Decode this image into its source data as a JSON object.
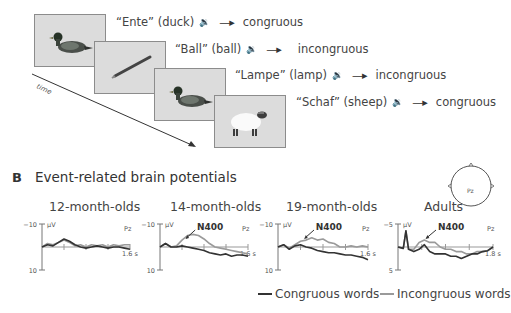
{
  "panelA": {
    "trials": [
      {
        "word": "“Ente” (duck)",
        "image": "duck",
        "condition": "congruous"
      },
      {
        "word": "“Ball” (ball)",
        "image": "pencil",
        "condition": "incongruous"
      },
      {
        "word": "“Lampe” (lamp)",
        "image": "duck",
        "condition": "incongruous"
      },
      {
        "word": "“Schaf” (sheep)",
        "image": "sheep",
        "condition": "congruous"
      }
    ],
    "time_axis_label": "time",
    "speaker_icon": "🔉",
    "arrow_icon": "→"
  },
  "panelB": {
    "label": "B",
    "title": "Event-related brain potentials",
    "electrode": "Pz",
    "legend": {
      "congruous": "Congruous words",
      "incongruous": "Incongruous words"
    },
    "colors": {
      "congruous": "#333333",
      "incongruous": "#9a9a9a"
    }
  },
  "chart_data": [
    {
      "type": "line",
      "title": "12-month-olds",
      "xlabel": "s",
      "ylabel": "μV",
      "x_end_label": "1.6 s",
      "ytick_top": "−10",
      "ytick_bottom": "10",
      "ylim": [
        -10,
        10
      ],
      "xlim": [
        0,
        1.6
      ],
      "y_inverted": true,
      "channel": "Pz",
      "annotation": null,
      "x": [
        0,
        0.1,
        0.2,
        0.3,
        0.4,
        0.5,
        0.6,
        0.7,
        0.8,
        0.9,
        1.0,
        1.1,
        1.2,
        1.3,
        1.4,
        1.5,
        1.6
      ],
      "series": [
        {
          "name": "Congruous words",
          "values": [
            0,
            -1,
            -0.5,
            -2,
            -3.5,
            -2.5,
            -1,
            0,
            0.5,
            0,
            -0.5,
            0,
            0.5,
            0,
            0,
            0.5,
            1
          ]
        },
        {
          "name": "Incongruous words",
          "values": [
            0,
            -1.5,
            -1,
            -2,
            -3,
            -2,
            -0.5,
            -1,
            0,
            -1,
            -0.5,
            -1,
            0,
            -1,
            -0.5,
            -1,
            -1
          ]
        }
      ]
    },
    {
      "type": "line",
      "title": "14-month-olds",
      "xlabel": "s",
      "ylabel": "μV",
      "x_end_label": "1.6 s",
      "ytick_top": "−10",
      "ytick_bottom": "10",
      "ylim": [
        -10,
        10
      ],
      "xlim": [
        0,
        1.6
      ],
      "y_inverted": true,
      "channel": "Pz",
      "annotation": "N400",
      "x": [
        0,
        0.1,
        0.2,
        0.3,
        0.4,
        0.5,
        0.6,
        0.7,
        0.8,
        0.9,
        1.0,
        1.1,
        1.2,
        1.3,
        1.4,
        1.5,
        1.6
      ],
      "series": [
        {
          "name": "Congruous words",
          "values": [
            0,
            -1.5,
            0,
            0,
            -0.5,
            0,
            0.5,
            1,
            1.5,
            2.5,
            3,
            3.5,
            3,
            4,
            3.5,
            3.5,
            4
          ]
        },
        {
          "name": "Incongruous words",
          "values": [
            0,
            -1.5,
            0,
            -0.5,
            -3,
            -5,
            -5.5,
            -5,
            -3.5,
            -1.5,
            0,
            0.5,
            1,
            1.5,
            2,
            2.5,
            3
          ]
        }
      ]
    },
    {
      "type": "line",
      "title": "19-month-olds",
      "xlabel": "s",
      "ylabel": "μV",
      "x_end_label": "1.6 s",
      "ytick_top": "−10",
      "ytick_bottom": "10",
      "ylim": [
        -10,
        10
      ],
      "xlim": [
        0,
        1.6
      ],
      "y_inverted": true,
      "channel": "Pz",
      "annotation": "N400",
      "x": [
        0,
        0.1,
        0.2,
        0.3,
        0.4,
        0.5,
        0.6,
        0.7,
        0.8,
        0.9,
        1.0,
        1.1,
        1.2,
        1.3,
        1.4,
        1.5,
        1.6
      ],
      "series": [
        {
          "name": "Congruous words",
          "values": [
            0,
            -1,
            1,
            -0.5,
            -1,
            0,
            0.5,
            1.5,
            2,
            2.5,
            2.5,
            3,
            3.5,
            3.5,
            4,
            4.5,
            5.5
          ]
        },
        {
          "name": "Incongruous words",
          "values": [
            0,
            -1,
            0.5,
            -1,
            -2.5,
            -3,
            -4,
            -3,
            -3.5,
            -2,
            -1.5,
            0,
            0,
            -0.5,
            0,
            -0.5,
            0
          ]
        }
      ]
    },
    {
      "type": "line",
      "title": "Adults",
      "xlabel": "s",
      "ylabel": "μV",
      "x_end_label": "1.8 s",
      "ytick_top": "−5",
      "ytick_bottom": "5",
      "ylim": [
        -5,
        5
      ],
      "xlim": [
        0,
        1.8
      ],
      "y_inverted": true,
      "channel": "Pz",
      "annotation": "N400",
      "x": [
        0,
        0.1,
        0.15,
        0.2,
        0.3,
        0.4,
        0.5,
        0.6,
        0.7,
        0.8,
        0.9,
        1.0,
        1.1,
        1.2,
        1.3,
        1.4,
        1.5,
        1.6,
        1.7,
        1.8
      ],
      "series": [
        {
          "name": "Congruous words",
          "values": [
            0,
            0.3,
            -3.5,
            0.5,
            1,
            0.5,
            -0.5,
            1,
            1.5,
            1.5,
            1.5,
            2,
            2,
            2.5,
            2,
            1.5,
            1.5,
            1,
            0.8,
            0
          ]
        },
        {
          "name": "Incongruous words",
          "values": [
            0,
            0.3,
            -3.5,
            0.5,
            0.5,
            -1,
            -1.5,
            -1,
            -1,
            0,
            0.5,
            0.5,
            1,
            1,
            1.5,
            1.5,
            1,
            1,
            0.8,
            0
          ]
        }
      ]
    }
  ]
}
